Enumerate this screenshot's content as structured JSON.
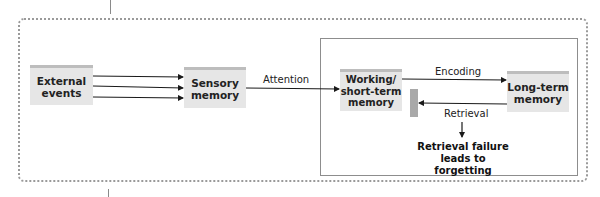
{
  "diagram": {
    "nodes": {
      "external_events": "External\nevents",
      "sensory_memory": "Sensory\nmemory",
      "working_memory": "Working/\nshort-term\nmemory",
      "long_term_memory": "Long-term\nmemory"
    },
    "edges": {
      "attention": "Attention",
      "encoding": "Encoding",
      "retrieval": "Retrieval"
    },
    "outcome": "Retrieval failure\nleads to forgetting"
  },
  "colors": {
    "box_fill": "#e6e6e6",
    "box_top": "#bdbdbd",
    "line": "#1a1a1a",
    "dotted_border": "#9a9a9a"
  }
}
